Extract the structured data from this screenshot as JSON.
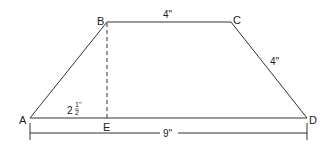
{
  "diagram": {
    "type": "trapezoid",
    "stroke_color": "#333333",
    "vertices": {
      "A": "A",
      "B": "B",
      "C": "C",
      "D": "D",
      "E": "E"
    },
    "measurements": {
      "top_BC": "4\"",
      "side_CD": "4\"",
      "height_BE_whole": "2",
      "height_BE_num": "1",
      "height_BE_den": "2",
      "height_BE_unit": "\"",
      "base_AD": "9\""
    }
  }
}
